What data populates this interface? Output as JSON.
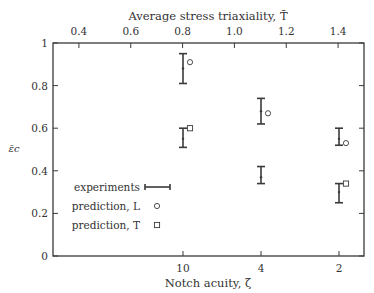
{
  "chart_data": {
    "type": "scatter",
    "title": "",
    "xlabel": "Notch acuity, ζ",
    "x2label": "Average stress triaxiality, T̄",
    "ylabel": "ε̄c",
    "ylim": [
      0,
      1
    ],
    "yticks": [
      "0",
      "0.2",
      "0.4",
      "0.6",
      "0.8",
      "1"
    ],
    "categories": [
      "10",
      "4",
      "2"
    ],
    "x2ticks": [
      "0.4",
      "0.6",
      "0.8",
      "1.0",
      "1.2",
      "1.4"
    ],
    "x2lim": [
      0.3,
      1.5
    ],
    "grid": false,
    "legend_position": "lower-left",
    "series": [
      {
        "name": "experiments",
        "kind": "errorbar",
        "points": [
          {
            "cat": "10",
            "group": "L",
            "low": 0.81,
            "high": 0.95,
            "mid": 0.88
          },
          {
            "cat": "10",
            "group": "T",
            "low": 0.51,
            "high": 0.6,
            "mid": 0.55
          },
          {
            "cat": "4",
            "group": "L",
            "low": 0.62,
            "high": 0.74,
            "mid": 0.68
          },
          {
            "cat": "4",
            "group": "T",
            "low": 0.34,
            "high": 0.42,
            "mid": 0.37
          },
          {
            "cat": "2",
            "group": "L",
            "low": 0.52,
            "high": 0.6,
            "mid": 0.55
          },
          {
            "cat": "2",
            "group": "T",
            "low": 0.25,
            "high": 0.34,
            "mid": 0.3
          }
        ]
      },
      {
        "name": "prediction, L",
        "kind": "circle",
        "points": [
          {
            "cat": "10",
            "y": 0.91
          },
          {
            "cat": "4",
            "y": 0.67
          },
          {
            "cat": "2",
            "y": 0.53
          }
        ]
      },
      {
        "name": "prediction, T",
        "kind": "square",
        "points": [
          {
            "cat": "10",
            "y": 0.6
          },
          {
            "cat": "2",
            "y": 0.34
          }
        ]
      }
    ]
  }
}
